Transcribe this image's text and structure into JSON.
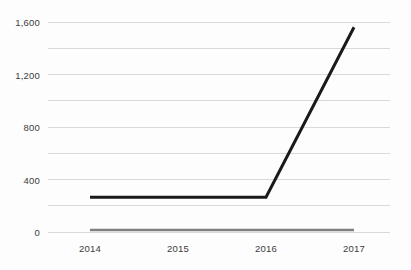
{
  "chart_data": {
    "type": "line",
    "title": "",
    "subtitle": "",
    "xlabel": "",
    "ylabel": "",
    "x": [
      2014,
      2015,
      2016,
      2017
    ],
    "categories": [
      "2014",
      "2015",
      "2016",
      "2017"
    ],
    "series": [
      {
        "name": "series-1",
        "color": "#1a1a1a",
        "values": [
          265,
          265,
          265,
          1560
        ]
      },
      {
        "name": "series-2",
        "color": "#808080",
        "values": [
          15,
          15,
          15,
          15
        ]
      }
    ],
    "ylim": [
      0,
      1600
    ],
    "y_ticks": [
      0,
      400,
      800,
      1200,
      1600
    ],
    "y_tick_labels": [
      "0",
      "400",
      "800",
      "1,200",
      "1,600"
    ],
    "y_minor_ticks": [
      200,
      600,
      1000,
      1400
    ],
    "x_tick_labels": [
      "2014",
      "2015",
      "2016",
      "2017"
    ],
    "grid": true,
    "grid_color": "#d9d9d9",
    "legend": "none",
    "legend_position": "none",
    "background_color": "#fdfdfd",
    "annotations": []
  }
}
